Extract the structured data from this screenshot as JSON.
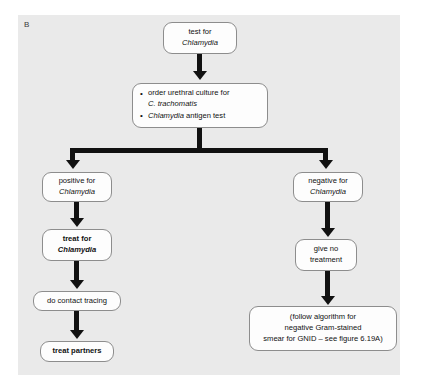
{
  "panel": {
    "label": "B"
  },
  "nodes": {
    "test": {
      "line1": "test for",
      "line2": "Chlamydia"
    },
    "orders": {
      "bullet1_part1": "order urethral culture for",
      "bullet1_part2": "C. trachomatis",
      "bullet2_italic": "Chlamydia",
      "bullet2_rest": " antigen test"
    },
    "positive": {
      "line1": "positive for",
      "line2": "Chlamydia"
    },
    "negative": {
      "line1": "negative for",
      "line2": "Chlamydia"
    },
    "treat_for": {
      "line1": "treat for",
      "line2": "Chlamydia"
    },
    "give_no_treatment": {
      "line1": "give no",
      "line2": "treatment"
    },
    "contact_tracing": {
      "line1": "do contact tracing"
    },
    "treat_partners": {
      "line1": "treat partners"
    },
    "follow_algorithm": {
      "line1": "(follow algorithm for",
      "line2": "negative Gram-stained",
      "line3": "smear for  GNID – see figure 6.19A)"
    }
  },
  "colors": {
    "panel_background": "#eaeaea",
    "node_fill": "#fdfdfd",
    "node_border": "#8d8d8d",
    "arrow": "#111111",
    "text": "#111111"
  }
}
